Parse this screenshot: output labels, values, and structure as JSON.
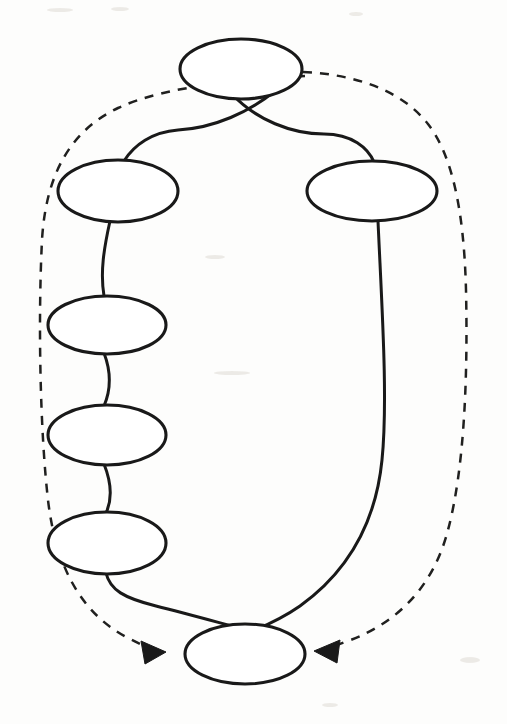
{
  "page": {
    "background_color": "#fdfdfc",
    "width": 507,
    "height": 724
  },
  "style": {
    "ink_color": "#191919",
    "dash_color": "#20201f",
    "node_fill": "#ffffff",
    "stroke_width": 3,
    "dash_pattern": "9 8"
  },
  "diagram": {
    "kind": "sketch-graph",
    "node_shape": "ellipse",
    "node_count": 7,
    "solid_edge_count": 8,
    "dashed_edge_count": 2,
    "arrowhead_count": 2,
    "nodes": [
      {
        "id": "n1",
        "label": "",
        "role": "top-node",
        "cx": 241,
        "cy": 69,
        "rx": 61,
        "ry": 30
      },
      {
        "id": "n2",
        "label": "",
        "role": "left-branch-1",
        "cx": 118,
        "cy": 191,
        "rx": 60,
        "ry": 31
      },
      {
        "id": "n3",
        "label": "",
        "role": "left-branch-2",
        "cx": 107,
        "cy": 325,
        "rx": 59,
        "ry": 29
      },
      {
        "id": "n4",
        "label": "",
        "role": "left-branch-3",
        "cx": 107,
        "cy": 435,
        "rx": 59,
        "ry": 30
      },
      {
        "id": "n5",
        "label": "",
        "role": "left-branch-4",
        "cx": 107,
        "cy": 543,
        "rx": 59,
        "ry": 31
      },
      {
        "id": "n6",
        "label": "",
        "role": "right-branch-1",
        "cx": 372,
        "cy": 191,
        "rx": 65,
        "ry": 30
      },
      {
        "id": "n7",
        "label": "",
        "role": "bottom-node",
        "cx": 245,
        "cy": 654,
        "rx": 60,
        "ry": 30
      }
    ],
    "solid_edges": [
      {
        "id": "e1",
        "from": "n1",
        "to": "n2",
        "crosses": true
      },
      {
        "id": "e2",
        "from": "n1",
        "to": "n6",
        "crosses": true
      },
      {
        "id": "e3",
        "from": "n2",
        "to": "n3",
        "crosses": false
      },
      {
        "id": "e4",
        "from": "n3",
        "to": "n4",
        "crosses": false
      },
      {
        "id": "e5",
        "from": "n4",
        "to": "n5",
        "crosses": false
      },
      {
        "id": "e6",
        "from": "n5",
        "to": "n7",
        "crosses": true
      },
      {
        "id": "e7",
        "from": "n6",
        "to": "n7",
        "crosses": true
      }
    ],
    "dashed_edges": [
      {
        "id": "d1",
        "from": "n1",
        "to": "n7",
        "side": "left",
        "arrow": "to-target",
        "arrow_direction": "right"
      },
      {
        "id": "d2",
        "from": "n1",
        "to": "n7",
        "side": "right",
        "arrow": "to-target",
        "arrow_direction": "left"
      }
    ]
  }
}
